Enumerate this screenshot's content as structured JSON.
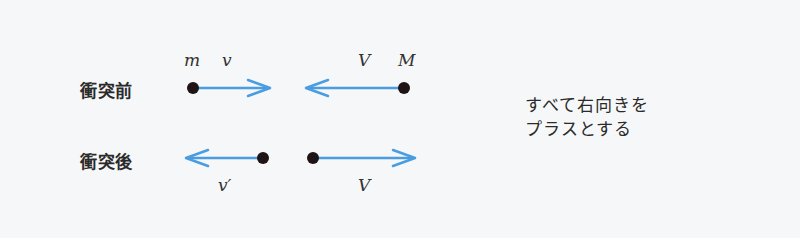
{
  "rows": {
    "before": {
      "label": "衝突前",
      "left_mass": "m",
      "left_velocity": "v",
      "right_velocity": "V",
      "right_mass": "M"
    },
    "after": {
      "label": "衝突後",
      "left_velocity": "v′",
      "right_velocity": "V"
    }
  },
  "note": {
    "line1": "すべて右向きを",
    "line2": "プラスとする"
  },
  "colors": {
    "arrow": "#4a9de0",
    "ball": "#1e1414",
    "background": "#f6f7f8"
  }
}
